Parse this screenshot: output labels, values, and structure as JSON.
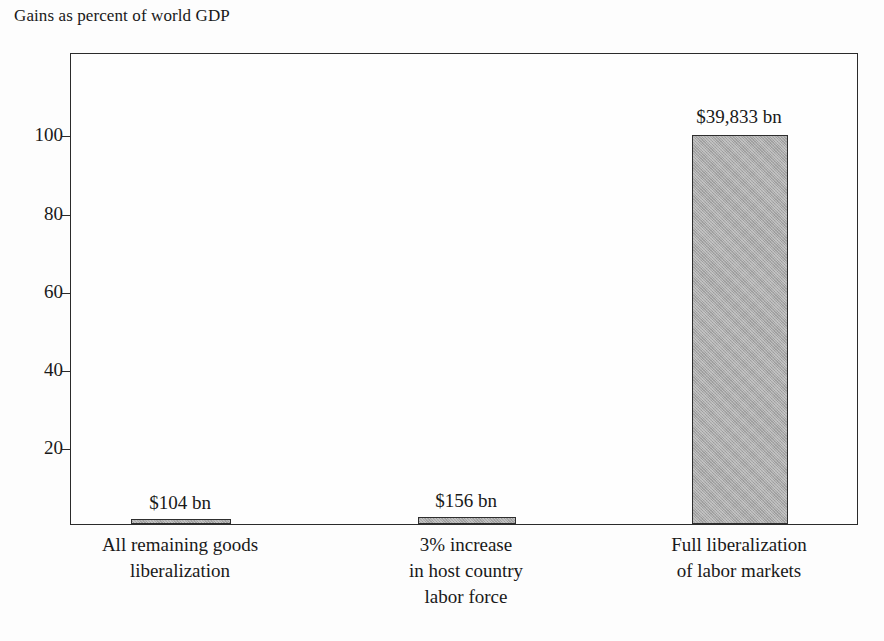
{
  "chart_data": {
    "type": "bar",
    "title": "Gains as percent of world GDP",
    "xlabel": "",
    "ylabel": "",
    "ylim": [
      0,
      121
    ],
    "yticks": [
      20,
      40,
      60,
      80,
      100
    ],
    "ytick_labels": [
      "20",
      "40",
      "60",
      "80",
      "100"
    ],
    "grid": false,
    "legend": "none",
    "categories": [
      "All remaining goods liberalization",
      "3% increase in host country labor force",
      "Full liberalization of labor markets"
    ],
    "category_lines": [
      [
        "All remaining goods",
        "liberalization"
      ],
      [
        "3% increase",
        "in host country",
        "labor force"
      ],
      [
        "Full liberalization",
        "of labor markets"
      ]
    ],
    "values": [
      0.26,
      0.39,
      99.5
    ],
    "data_labels": [
      "$104 bn",
      "$156 bn",
      "$39,833 bn"
    ],
    "value_dollars_bn": [
      104,
      156,
      39833
    ],
    "bar_color": "#a9a9a9",
    "bar_edge_color": "#2e2e2e",
    "axis_color": "#2b2b2b",
    "background_color": "#fdfdfd",
    "text_color": "#191919"
  },
  "layout": {
    "plot": {
      "left": 70,
      "top": 53,
      "width": 788,
      "height": 472
    },
    "bars": [
      {
        "center": 180,
        "width": 100,
        "top_px": 519,
        "height_px": 5
      },
      {
        "center": 466,
        "width": 98,
        "top_px": 517,
        "height_px": 7
      },
      {
        "center": 739,
        "width": 96,
        "top_px": 135,
        "height_px": 389
      }
    ],
    "value_label_y": [
      492,
      490,
      106
    ],
    "category_label_y": [
      532,
      532,
      532
    ],
    "ytick_y_px": [
      448,
      370,
      292,
      214,
      135
    ]
  }
}
